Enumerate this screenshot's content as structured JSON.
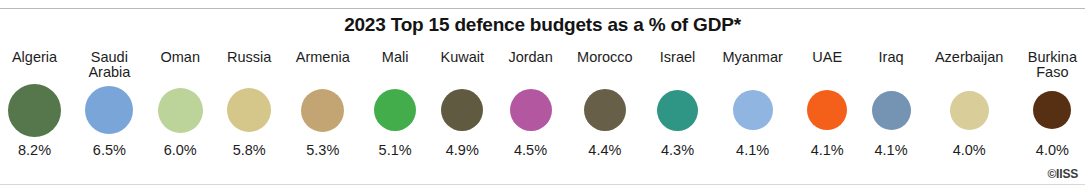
{
  "title": "2023 Top 15 defence budgets as a % of GDP*",
  "credit": "©IISS",
  "chart_data": {
    "type": "bar",
    "title": "2023 Top 15 defence budgets as a % of GDP*",
    "xlabel": "",
    "ylabel": "Defence budget as a % of GDP",
    "grid": false,
    "legend": "none",
    "units": "percent of GDP",
    "categories": [
      "Algeria",
      "Saudi Arabia",
      "Oman",
      "Russia",
      "Armenia",
      "Mali",
      "Kuwait",
      "Jordan",
      "Morocco",
      "Israel",
      "Myanmar",
      "UAE",
      "Iraq",
      "Azerbaijan",
      "Burkina Faso"
    ],
    "values": [
      8.2,
      6.5,
      6.0,
      5.8,
      5.3,
      5.1,
      4.9,
      4.5,
      4.4,
      4.3,
      4.1,
      4.1,
      4.1,
      4.0,
      4.0
    ],
    "value_labels": [
      "8.2%",
      "6.5%",
      "6.0%",
      "5.8%",
      "5.3%",
      "5.1%",
      "4.9%",
      "4.5%",
      "4.4%",
      "4.3%",
      "4.1%",
      "4.1%",
      "4.1%",
      "4.0%",
      "4.0%"
    ],
    "colors": [
      "#55774b",
      "#7aa5d8",
      "#bcd39a",
      "#d5c689",
      "#c2a572",
      "#43ad4c",
      "#5f5a40",
      "#b358a0",
      "#685f48",
      "#2f9685",
      "#8fb5e0",
      "#f4601a",
      "#7593b2",
      "#d9cd9a",
      "#572f12"
    ],
    "marker_px": [
      53,
      48,
      45,
      44,
      43,
      42,
      42,
      42,
      42,
      41,
      40,
      40,
      39,
      39,
      38
    ],
    "ylim": [
      0,
      8.2
    ]
  },
  "items": [
    {
      "label": "Algeria",
      "value_label": "8.2%",
      "color": "#55774b",
      "size": 53
    },
    {
      "label": "Saudi\nArabia",
      "value_label": "6.5%",
      "color": "#7aa5d8",
      "size": 48
    },
    {
      "label": "Oman",
      "value_label": "6.0%",
      "color": "#bcd39a",
      "size": 45
    },
    {
      "label": "Russia",
      "value_label": "5.8%",
      "color": "#d5c689",
      "size": 44
    },
    {
      "label": "Armenia",
      "value_label": "5.3%",
      "color": "#c2a572",
      "size": 43
    },
    {
      "label": "Mali",
      "value_label": "5.1%",
      "color": "#43ad4c",
      "size": 42
    },
    {
      "label": "Kuwait",
      "value_label": "4.9%",
      "color": "#5f5a40",
      "size": 42
    },
    {
      "label": "Jordan",
      "value_label": "4.5%",
      "color": "#b358a0",
      "size": 42
    },
    {
      "label": "Morocco",
      "value_label": "4.4%",
      "color": "#685f48",
      "size": 42
    },
    {
      "label": "Israel",
      "value_label": "4.3%",
      "color": "#2f9685",
      "size": 41
    },
    {
      "label": "Myanmar",
      "value_label": "4.1%",
      "color": "#8fb5e0",
      "size": 40
    },
    {
      "label": "UAE",
      "value_label": "4.1%",
      "color": "#f4601a",
      "size": 40
    },
    {
      "label": "Iraq",
      "value_label": "4.1%",
      "color": "#7593b2",
      "size": 39
    },
    {
      "label": "Azerbaijan",
      "value_label": "4.0%",
      "color": "#d9cd9a",
      "size": 39
    },
    {
      "label": "Burkina\nFaso",
      "value_label": "4.0%",
      "color": "#572f12",
      "size": 38
    }
  ]
}
